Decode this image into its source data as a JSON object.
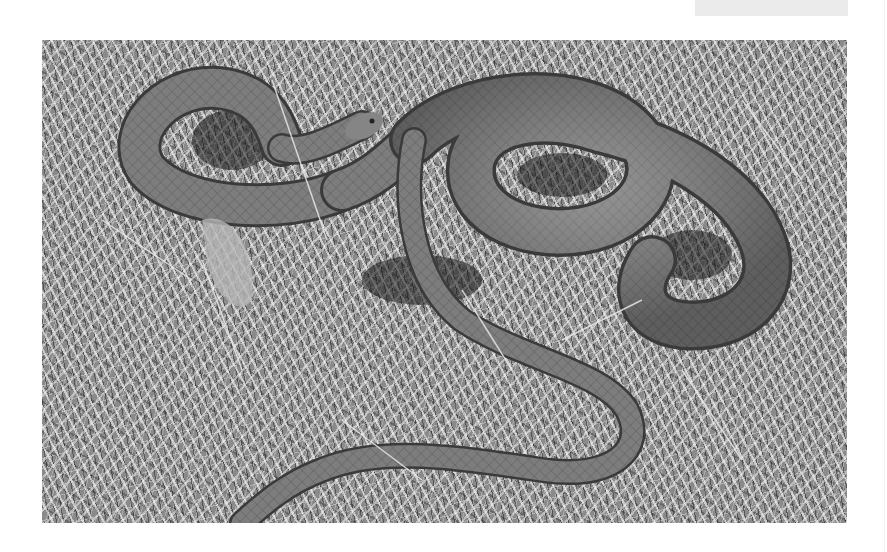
{
  "page": {
    "background": "#ffffff",
    "top_tab_color": "#ebebeb"
  },
  "photo": {
    "subject": "snake coiled on dry grass",
    "tone": "black-and-white",
    "colors": {
      "snake_body": "#7a7a7a",
      "snake_shadow": "#3c3c3c",
      "grass_light": "#e6e6e6",
      "grass_dark": "#1e1e1e"
    }
  }
}
